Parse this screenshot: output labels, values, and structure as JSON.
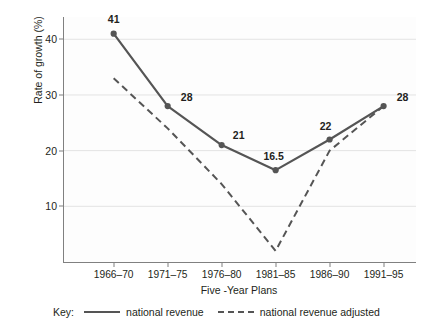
{
  "chart_data": {
    "type": "line",
    "title": "",
    "xlabel": "Five -Year Plans",
    "ylabel": "Rate of growth (%)",
    "categories": [
      "1966–70",
      "1971–75",
      "1976–80",
      "1981–85",
      "1986–90",
      "1991–95"
    ],
    "yticks": [
      10,
      20,
      30,
      40
    ],
    "ylim": [
      0,
      44
    ],
    "grid": true,
    "legend_position": "bottom",
    "series": [
      {
        "name": "national revenue",
        "style": "solid",
        "color": "#555555",
        "markers": true,
        "values": [
          41,
          28,
          21,
          16.5,
          22,
          28
        ],
        "data_labels": [
          "41",
          "28",
          "21",
          "16.5",
          "22",
          "28"
        ]
      },
      {
        "name": "national revenue adjusted",
        "style": "dashed",
        "color": "#555555",
        "markers": false,
        "values": [
          33,
          24,
          14,
          2,
          20,
          28
        ],
        "data_labels": [
          "",
          "",
          "",
          "",
          "",
          ""
        ]
      }
    ]
  },
  "axes": {
    "y_label": "Rate of growth (%)",
    "x_label": "Five -Year Plans",
    "y_tick_labels": [
      "40",
      "30",
      "20",
      "10"
    ],
    "x_tick_labels": [
      "1966–70",
      "1971–75",
      "1976–80",
      "1981–85",
      "1986–90",
      "1991–95"
    ]
  },
  "legend": {
    "key_text": "Key:",
    "entries": [
      {
        "label": "national revenue",
        "style": "solid"
      },
      {
        "label": "national revenue adjusted",
        "style": "dashed"
      }
    ]
  },
  "colors": {
    "line": "#555555",
    "axis": "#808080",
    "grid": "#e3e3e3",
    "text": "#231f20",
    "background": "#ffffff"
  }
}
